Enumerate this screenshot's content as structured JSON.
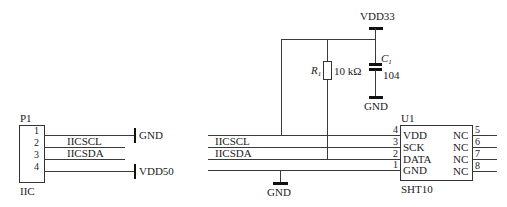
{
  "schematic": {
    "connector_p1": {
      "designator": "P1",
      "footer": "IIC",
      "pins": [
        "1",
        "2",
        "3",
        "4"
      ],
      "nets": {
        "pin1": "GND",
        "pin2": "IICSCL",
        "pin3": "IICSDA",
        "pin4": "VDD50"
      }
    },
    "power": {
      "vdd33": "VDD33",
      "gnd_cap": "GND",
      "gnd_bottom": "GND"
    },
    "resistor": {
      "designator": "R",
      "designator_sub": "1",
      "value": "10 kΩ"
    },
    "capacitor": {
      "designator": "C",
      "designator_sub": "1",
      "value": "104"
    },
    "bus_labels": {
      "scl": "IICSCL",
      "sda": "IICSDA"
    },
    "sensor_u1": {
      "designator": "U1",
      "part": "SHT10",
      "left_pins": [
        {
          "num": "4",
          "name": "VDD"
        },
        {
          "num": "3",
          "name": "SCK"
        },
        {
          "num": "2",
          "name": "DATA"
        },
        {
          "num": "1",
          "name": "GND"
        }
      ],
      "right_pins": [
        {
          "num": "5",
          "name": "NC"
        },
        {
          "num": "6",
          "name": "NC"
        },
        {
          "num": "7",
          "name": "NC"
        },
        {
          "num": "8",
          "name": "NC"
        }
      ]
    }
  }
}
